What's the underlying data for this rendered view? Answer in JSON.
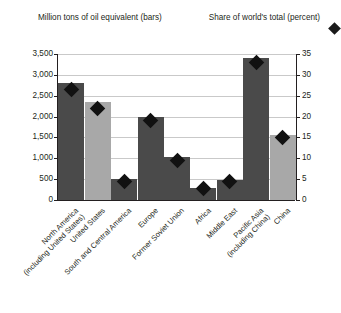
{
  "header": {
    "left_caption_line1": "Million tons of oil equivalent",
    "left_caption_line2": "(bars)",
    "right_caption_line1": "Share of world's total",
    "right_caption_line2": "(percent)",
    "legend_marker_icon": "diamond-icon"
  },
  "colors": {
    "bar_dark": "#4a4a4a",
    "bar_light": "#a8a8a8",
    "marker": "#111111",
    "axis": "#231f20",
    "grid": "#c9c9c9",
    "background": "#ffffff"
  },
  "chart_data": {
    "type": "bar",
    "title": "",
    "subtitle": "",
    "xlabel": "",
    "ylabel": "Million tons of oil equivalent (bars)",
    "y2label": "Share of world's total (percent)",
    "ylim": [
      0,
      3500
    ],
    "y2lim": [
      0,
      35
    ],
    "yticks": [
      0,
      500,
      1000,
      1500,
      2000,
      2500,
      3000,
      3500
    ],
    "ytick_labels": [
      "0",
      "500",
      "1,000",
      "1,500",
      "2,000",
      "2,500",
      "3,000",
      "3,500"
    ],
    "y2ticks": [
      0,
      5,
      10,
      15,
      20,
      25,
      30,
      35
    ],
    "y2tick_labels": [
      "0",
      "5",
      "10",
      "15",
      "20",
      "25",
      "30",
      "35"
    ],
    "grid": true,
    "legend_position": "top-right",
    "categories": [
      "North America (including United States)",
      "United States",
      "South and Central America",
      "Europe",
      "Former Soviet Union",
      "Africa",
      "Middle East",
      "Pacific Asia (including China)",
      "China"
    ],
    "category_label_lines": [
      [
        "North America",
        "(including United States)"
      ],
      [
        "United States"
      ],
      [
        "South and Central America"
      ],
      [
        "Europe"
      ],
      [
        "Former Soviet Union"
      ],
      [
        "Africa"
      ],
      [
        "Middle East"
      ],
      [
        "Pacific Asia",
        "(including China)"
      ],
      [
        "China"
      ]
    ],
    "series": [
      {
        "name": "Million tons of oil equivalent",
        "axis": "left",
        "type": "bar",
        "values": [
          2800,
          2350,
          500,
          1980,
          1020,
          300,
          480,
          3400,
          1550
        ],
        "shades": [
          "dark",
          "light",
          "dark",
          "dark",
          "dark",
          "dark",
          "dark",
          "dark",
          "light"
        ]
      },
      {
        "name": "Share of world's total",
        "axis": "right",
        "type": "marker",
        "marker": "diamond",
        "values": [
          26.5,
          22.0,
          4.5,
          19.0,
          9.5,
          2.8,
          4.5,
          33.0,
          15.0
        ]
      }
    ]
  }
}
